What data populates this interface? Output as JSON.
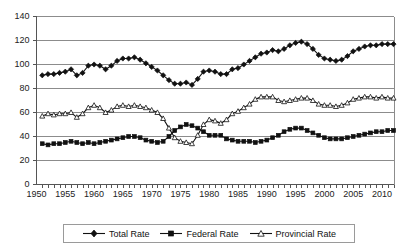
{
  "chart_data": {
    "type": "line",
    "title": "",
    "xlabel": "",
    "ylabel": "",
    "xlim": [
      1950,
      2012
    ],
    "ylim": [
      0,
      140
    ],
    "ytick_step": 20,
    "xtick_step": 5,
    "grid": true,
    "legend_position": "bottom",
    "ytick_labels": [
      "0",
      "20",
      "40",
      "60",
      "80",
      "100",
      "120",
      "140"
    ],
    "xtick_labels": [
      "1950",
      "1955",
      "1960",
      "1965",
      "1970",
      "1975",
      "1980",
      "1985",
      "1990",
      "1995",
      "2000",
      "2005",
      "2010"
    ],
    "x": [
      1951,
      1952,
      1953,
      1954,
      1955,
      1956,
      1957,
      1958,
      1959,
      1960,
      1961,
      1962,
      1963,
      1964,
      1965,
      1966,
      1967,
      1968,
      1969,
      1970,
      1971,
      1972,
      1973,
      1974,
      1975,
      1976,
      1977,
      1978,
      1979,
      1980,
      1981,
      1982,
      1983,
      1984,
      1985,
      1986,
      1987,
      1988,
      1989,
      1990,
      1991,
      1992,
      1993,
      1994,
      1995,
      1996,
      1997,
      1998,
      1999,
      2000,
      2001,
      2002,
      2003,
      2004,
      2005,
      2006,
      2007,
      2008,
      2009,
      2010,
      2011,
      2012
    ],
    "series": [
      {
        "name": "Total Rate",
        "marker": "diamond",
        "color": "#111111",
        "values": [
          91,
          92,
          92,
          93,
          94,
          96,
          91,
          93,
          99,
          100,
          99,
          96,
          99,
          103,
          105,
          105,
          106,
          104,
          101,
          98,
          95,
          91,
          87,
          84,
          84,
          85,
          83,
          88,
          94,
          95,
          94,
          92,
          92,
          96,
          97,
          100,
          103,
          106,
          109,
          110,
          112,
          111,
          113,
          116,
          118,
          119,
          117,
          113,
          108,
          105,
          104,
          103,
          104,
          107,
          111,
          113,
          115,
          116,
          116,
          117,
          117,
          117
        ]
      },
      {
        "name": "Federal Rate",
        "marker": "square",
        "color": "#111111",
        "values": [
          34,
          33,
          34,
          34,
          35,
          36,
          35,
          34,
          35,
          34,
          35,
          36,
          37,
          38,
          39,
          40,
          40,
          39,
          37,
          36,
          35,
          36,
          40,
          45,
          48,
          50,
          49,
          47,
          44,
          41,
          41,
          41,
          38,
          37,
          36,
          36,
          36,
          35,
          36,
          37,
          39,
          41,
          44,
          46,
          47,
          47,
          45,
          43,
          41,
          39,
          38,
          38,
          38,
          39,
          40,
          41,
          42,
          43,
          44,
          44,
          45,
          45
        ]
      },
      {
        "name": "Provincial Rate",
        "marker": "triangle",
        "color": "#111111",
        "values": [
          57,
          59,
          58,
          59,
          59,
          60,
          56,
          59,
          64,
          66,
          64,
          60,
          62,
          65,
          66,
          65,
          66,
          65,
          64,
          62,
          60,
          55,
          47,
          39,
          36,
          35,
          34,
          41,
          50,
          54,
          53,
          51,
          54,
          59,
          61,
          64,
          67,
          71,
          73,
          73,
          73,
          70,
          69,
          70,
          71,
          72,
          72,
          70,
          67,
          66,
          66,
          65,
          66,
          68,
          71,
          72,
          73,
          73,
          72,
          73,
          72,
          72
        ]
      }
    ]
  },
  "legend": {
    "items": [
      {
        "label": "Total Rate",
        "marker": "diamond"
      },
      {
        "label": "Federal Rate",
        "marker": "square"
      },
      {
        "label": "Provincial Rate",
        "marker": "triangle"
      }
    ]
  }
}
